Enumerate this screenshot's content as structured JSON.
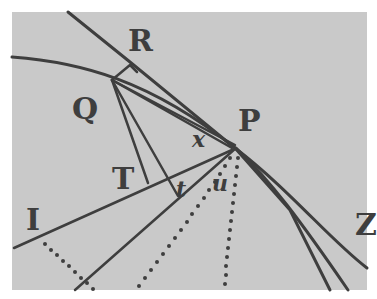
{
  "figure": {
    "type": "geometric-diagram",
    "colors": {
      "background": "#c9c9c9",
      "border": "#ffffff",
      "ink": "#3e3e3e"
    },
    "labels": {
      "R": "R",
      "Q": "Q",
      "P": "P",
      "T": "T",
      "I": "I",
      "Z": "Z",
      "x": "x",
      "t": "t",
      "u": "u"
    }
  }
}
